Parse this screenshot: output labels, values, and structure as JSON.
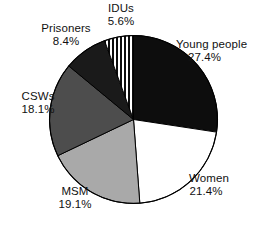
{
  "chart_data": {
    "type": "pie",
    "title": "",
    "xlabel": "",
    "ylabel": "",
    "legend_position": "none",
    "grid": false,
    "start_angle_deg": 0,
    "direction": "clockwise",
    "units": "percent",
    "total": 100.0,
    "categories": [
      "Young people",
      "Women",
      "MSM",
      "CSWs",
      "Prisoners",
      "IDUs"
    ],
    "values": [
      27.4,
      21.4,
      19.1,
      18.1,
      8.4,
      5.6
    ],
    "slices": [
      {
        "label": "Young people",
        "value": 27.4,
        "value_text": "27.4%",
        "fill": "#0d0d0d",
        "pattern": "solid"
      },
      {
        "label": "Women",
        "value": 21.4,
        "value_text": "21.4%",
        "fill": "#ffffff",
        "pattern": "solid"
      },
      {
        "label": "MSM",
        "value": 19.1,
        "value_text": "19.1%",
        "fill": "#a9a9a9",
        "pattern": "solid"
      },
      {
        "label": "CSWs",
        "value": 18.1,
        "value_text": "18.1%",
        "fill": "#4d4d4d",
        "pattern": "solid"
      },
      {
        "label": "Prisoners",
        "value": 8.4,
        "value_text": "8.4%",
        "fill": "#1a1a1a",
        "pattern": "solid"
      },
      {
        "label": "IDUs",
        "value": 5.6,
        "value_text": "5.6%",
        "fill": "#ffffff",
        "pattern": "vertical-stripes"
      }
    ]
  },
  "labels": {
    "young_people": {
      "name": "Young people",
      "percent": "27.4%"
    },
    "women": {
      "name": "Women",
      "percent": "21.4%"
    },
    "msm": {
      "name": "MSM",
      "percent": "19.1%"
    },
    "csws": {
      "name": "CSWs",
      "percent": "18.1%"
    },
    "prisoners": {
      "name": "Prisoners",
      "percent": "8.4%"
    },
    "idus": {
      "name": "IDUs",
      "percent": "5.6%"
    }
  },
  "colors": {
    "outline": "#000000",
    "background": "#ffffff",
    "text": "#111111"
  }
}
